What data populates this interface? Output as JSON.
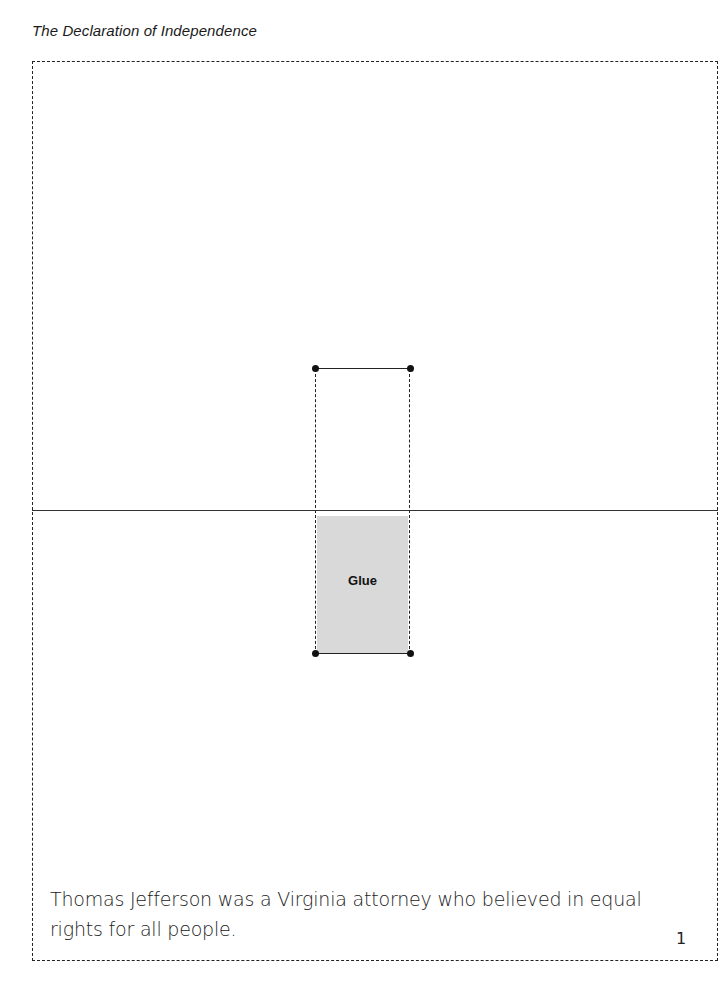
{
  "header": {
    "title": "The Declaration of Independence"
  },
  "fold_tab": {
    "glue_label": "Glue"
  },
  "caption": {
    "text": "Thomas Jefferson was a Virginia attorney who believed in equal rights for all people."
  },
  "footer": {
    "page_number": "1"
  },
  "colors": {
    "glue_fill": "#d9d9d9",
    "line": "#222222"
  }
}
